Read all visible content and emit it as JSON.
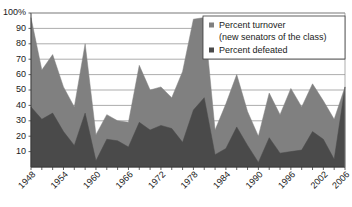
{
  "chart_data": {
    "type": "area",
    "title": "",
    "subtitle": "",
    "xlabel": "",
    "ylabel": "",
    "ylim": [
      0,
      100
    ],
    "ytick_labels": [
      "100%",
      "90",
      "80",
      "70",
      "60",
      "50",
      "40",
      "30",
      "20",
      "10"
    ],
    "ytick_values": [
      100,
      90,
      80,
      70,
      60,
      50,
      40,
      30,
      20,
      10
    ],
    "grid": true,
    "legend_position": "top-right",
    "stacked": false,
    "x": [
      1948,
      1950,
      1952,
      1954,
      1956,
      1958,
      1960,
      1962,
      1964,
      1966,
      1968,
      1970,
      1972,
      1974,
      1976,
      1978,
      1980,
      1982,
      1984,
      1986,
      1988,
      1990,
      1992,
      1994,
      1996,
      1998,
      2000,
      2002,
      2004,
      2006
    ],
    "xtick_labels": [
      "1948",
      "1954",
      "1960",
      "1966",
      "1972",
      "1978",
      "1984",
      "1990",
      "1996",
      "2002",
      "2006"
    ],
    "xtick_label_values": [
      1948,
      1954,
      1960,
      1966,
      1972,
      1978,
      1984,
      1990,
      1996,
      2002,
      2006
    ],
    "series": [
      {
        "name": "Percent turnover (new senators of the class)",
        "legend_label_line1": "Percent turnover",
        "legend_label_line2": "(new senators of the class)",
        "color": "#808080",
        "values": [
          97,
          63,
          73,
          52,
          39,
          80,
          21,
          34,
          30,
          29,
          66,
          50,
          52,
          45,
          62,
          96,
          97,
          24,
          41,
          60,
          36,
          20,
          48,
          34,
          51,
          39,
          54,
          43,
          31,
          52
        ]
      },
      {
        "name": "Percent defeated",
        "legend_label": "Percent defeated",
        "color": "#4a4a4a",
        "values": [
          39,
          31,
          35,
          23,
          14,
          35,
          4,
          18,
          17,
          13,
          29,
          24,
          27,
          25,
          16,
          37,
          45,
          8,
          12,
          26,
          14,
          3,
          19,
          9,
          10,
          11,
          23,
          18,
          5,
          52
        ]
      }
    ]
  }
}
